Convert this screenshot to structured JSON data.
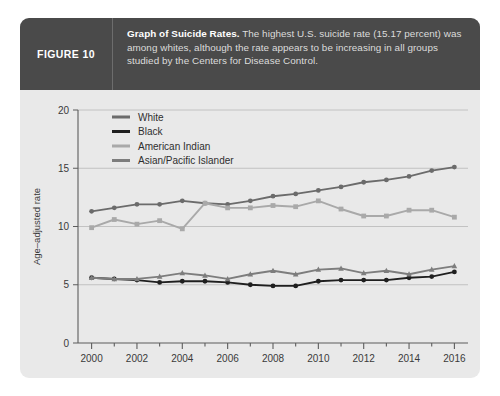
{
  "figure": {
    "label": "FIGURE 10",
    "caption_bold": "Graph of Suicide Rates.",
    "caption_rest": " The highest U.S. suicide rate (15.17 percent) was among whites, although the rate appears to be increasing in all groups studied by the Centers for Disease Control."
  },
  "colors": {
    "panel_background": "#e9e9e9",
    "caption_background": "#4a4a4a",
    "caption_text": "#dcdcdc",
    "white_series": "#6b6b6b",
    "black_series": "#1f1f1f",
    "american_indian_series": "#a9a9a9",
    "asian_pacific_islander_series": "#7d7d7d",
    "gridline": "#b8b8b8",
    "axis": "#5d5d5d"
  },
  "chart_data": {
    "type": "line",
    "title": "Graph of Suicide Rates",
    "xlabel": "",
    "ylabel": "Age–adjusted rate",
    "xlim": [
      1999.4,
      2016.6
    ],
    "ylim": [
      0,
      20
    ],
    "yticks": [
      0,
      5,
      10,
      15,
      20
    ],
    "ytick_labels": [
      "0",
      "5",
      "10",
      "15",
      "20"
    ],
    "xticks": [
      2000,
      2002,
      2004,
      2006,
      2008,
      2010,
      2012,
      2014,
      2016
    ],
    "xtick_labels": [
      "2000",
      "2002",
      "2004",
      "2006",
      "2008",
      "2010",
      "2012",
      "2014",
      "2016"
    ],
    "minor_xticks": [
      2001,
      2003,
      2005,
      2007,
      2009,
      2011,
      2013,
      2015
    ],
    "grid": "horizontal",
    "legend_position": "top-left-inside",
    "x": [
      2000,
      2001,
      2002,
      2003,
      2004,
      2005,
      2006,
      2007,
      2008,
      2009,
      2010,
      2011,
      2012,
      2013,
      2014,
      2015,
      2016
    ],
    "series": [
      {
        "name": "White",
        "color": "#6b6b6b",
        "marker": "circle",
        "values": [
          11.3,
          11.6,
          11.9,
          11.9,
          12.2,
          12.0,
          11.9,
          12.2,
          12.6,
          12.8,
          13.1,
          13.4,
          13.8,
          14.0,
          14.3,
          14.8,
          15.1
        ]
      },
      {
        "name": "Black",
        "color": "#1f1f1f",
        "marker": "circle",
        "values": [
          5.6,
          5.5,
          5.4,
          5.2,
          5.3,
          5.3,
          5.2,
          5.0,
          4.9,
          4.9,
          5.3,
          5.4,
          5.4,
          5.4,
          5.6,
          5.7,
          6.1
        ]
      },
      {
        "name": "American Indian",
        "color": "#a9a9a9",
        "marker": "square",
        "values": [
          9.9,
          10.6,
          10.2,
          10.5,
          9.8,
          12.0,
          11.6,
          11.6,
          11.8,
          11.7,
          12.2,
          11.5,
          10.9,
          10.9,
          11.4,
          11.4,
          10.8
        ]
      },
      {
        "name": "Asian/Pacific Islander",
        "color": "#7d7d7d",
        "marker": "triangle",
        "values": [
          5.6,
          5.5,
          5.5,
          5.7,
          6.0,
          5.8,
          5.5,
          5.9,
          6.2,
          5.9,
          6.3,
          6.4,
          6.0,
          6.2,
          5.9,
          6.3,
          6.6
        ]
      }
    ],
    "legend_entries": [
      "White",
      "Black",
      "American Indian",
      "Asian/Pacific Islander"
    ]
  }
}
